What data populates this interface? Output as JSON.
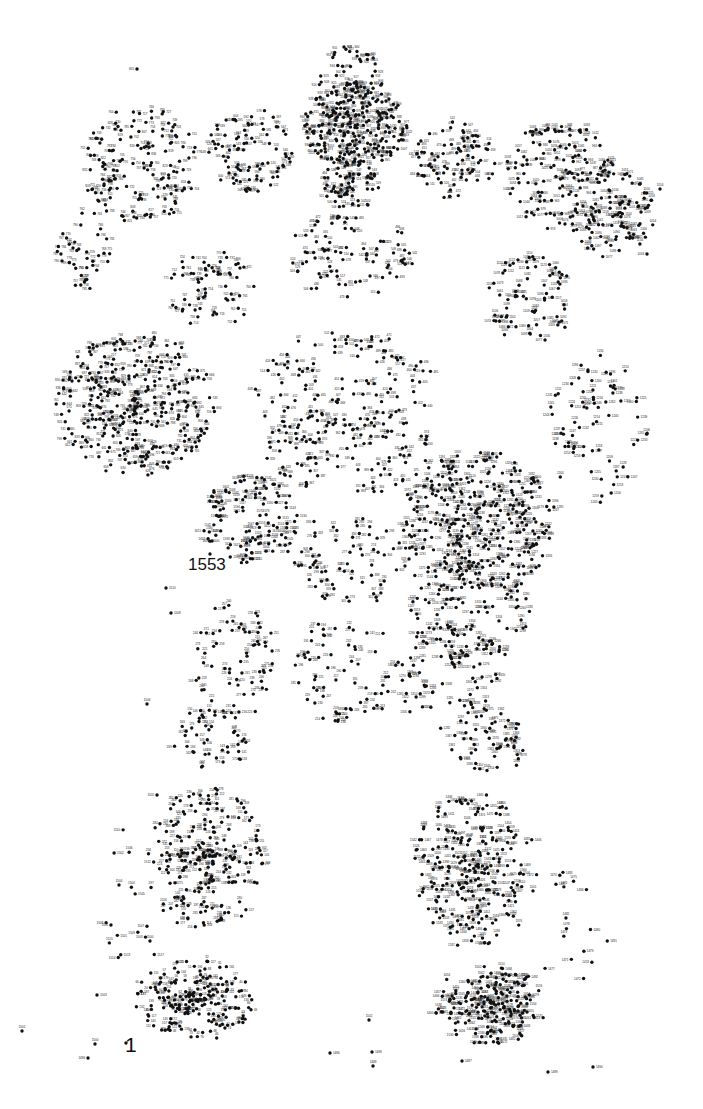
{
  "page": {
    "width": 703,
    "height": 1109,
    "background_color": "#ffffff",
    "dot_color": "#111111",
    "label_color": "#222222",
    "dot_radius": 1.7,
    "label_font_size": 3.0,
    "total_dots": 1553,
    "kind": "connect-the-dots puzzle"
  },
  "markers": {
    "start": {
      "number": "1",
      "x": 125,
      "y": 1034,
      "dot_x": 126,
      "dot_y": 1043
    },
    "end": {
      "number": "1553",
      "x": 188,
      "y": 556,
      "dot_x": 210,
      "dot_y": 554
    }
  },
  "regions": [
    {
      "name": "head-hair-crown",
      "cx": 350,
      "cy": 75,
      "rx": 34,
      "ry": 26,
      "count": 42,
      "num_start": 900,
      "density": "sparse"
    },
    {
      "name": "head-hair-mass",
      "cx": 355,
      "cy": 125,
      "rx": 52,
      "ry": 42,
      "count": 235,
      "num_start": 810,
      "density": "very-dense"
    },
    {
      "name": "face-neck",
      "cx": 352,
      "cy": 180,
      "rx": 30,
      "ry": 30,
      "count": 70,
      "num_start": 480,
      "density": "medium"
    },
    {
      "name": "left-shoulder-upper",
      "cx": 250,
      "cy": 150,
      "rx": 42,
      "ry": 42,
      "count": 85,
      "num_start": 520,
      "density": "sparse"
    },
    {
      "name": "right-shoulder-upper",
      "cx": 455,
      "cy": 160,
      "rx": 40,
      "ry": 40,
      "count": 80,
      "num_start": 440,
      "density": "sparse"
    },
    {
      "name": "left-arm-upper",
      "cx": 140,
      "cy": 165,
      "rx": 60,
      "ry": 58,
      "count": 140,
      "num_start": 700,
      "density": "medium"
    },
    {
      "name": "right-arm-upper",
      "cx": 560,
      "cy": 175,
      "rx": 55,
      "ry": 55,
      "count": 130,
      "num_start": 960,
      "density": "medium"
    },
    {
      "name": "right-hand-far",
      "cx": 612,
      "cy": 215,
      "rx": 42,
      "ry": 45,
      "count": 95,
      "num_start": 1040,
      "density": "medium"
    },
    {
      "name": "left-hand-far",
      "cx": 85,
      "cy": 250,
      "rx": 30,
      "ry": 40,
      "count": 38,
      "num_start": 755,
      "density": "sparse"
    },
    {
      "name": "torso-chest",
      "cx": 350,
      "cy": 255,
      "rx": 65,
      "ry": 42,
      "count": 80,
      "num_start": 470,
      "density": "sparse"
    },
    {
      "name": "left-forearm",
      "cx": 210,
      "cy": 290,
      "rx": 45,
      "ry": 40,
      "count": 60,
      "num_start": 712,
      "density": "sparse"
    },
    {
      "name": "right-forearm",
      "cx": 530,
      "cy": 300,
      "rx": 50,
      "ry": 45,
      "count": 70,
      "num_start": 1055,
      "density": "sparse"
    },
    {
      "name": "left-hand-cluster",
      "cx": 135,
      "cy": 405,
      "rx": 80,
      "ry": 72,
      "count": 330,
      "num_start": 555,
      "density": "very-dense"
    },
    {
      "name": "torso-mid",
      "cx": 345,
      "cy": 390,
      "rx": 90,
      "ry": 60,
      "count": 120,
      "num_start": 400,
      "density": "sparse"
    },
    {
      "name": "torso-lower",
      "cx": 350,
      "cy": 450,
      "rx": 85,
      "ry": 45,
      "count": 95,
      "num_start": 340,
      "density": "sparse"
    },
    {
      "name": "right-hand-cluster",
      "cx": 480,
      "cy": 520,
      "rx": 78,
      "ry": 70,
      "count": 300,
      "num_start": 1100,
      "density": "very-dense"
    },
    {
      "name": "right-arm-lower-far",
      "cx": 600,
      "cy": 430,
      "rx": 52,
      "ry": 75,
      "count": 70,
      "num_start": 1195,
      "density": "sparse"
    },
    {
      "name": "pocket-left",
      "cx": 250,
      "cy": 520,
      "rx": 48,
      "ry": 45,
      "count": 110,
      "num_start": 1515,
      "density": "medium"
    },
    {
      "name": "hips-center",
      "cx": 350,
      "cy": 560,
      "rx": 70,
      "ry": 45,
      "count": 70,
      "num_start": 270,
      "density": "sparse"
    },
    {
      "name": "right-hip-cluster",
      "cx": 470,
      "cy": 610,
      "rx": 60,
      "ry": 60,
      "count": 125,
      "num_start": 1230,
      "density": "medium"
    },
    {
      "name": "left-thigh",
      "cx": 235,
      "cy": 660,
      "rx": 42,
      "ry": 60,
      "count": 65,
      "num_start": 215,
      "density": "sparse"
    },
    {
      "name": "center-legs-upper",
      "cx": 345,
      "cy": 670,
      "rx": 55,
      "ry": 55,
      "count": 65,
      "num_start": 185,
      "density": "sparse"
    },
    {
      "name": "right-thigh",
      "cx": 450,
      "cy": 680,
      "rx": 50,
      "ry": 60,
      "count": 60,
      "num_start": 1265,
      "density": "sparse"
    },
    {
      "name": "left-knee",
      "cx": 210,
      "cy": 740,
      "rx": 38,
      "ry": 32,
      "count": 45,
      "num_start": 140,
      "density": "sparse"
    },
    {
      "name": "right-knee",
      "cx": 490,
      "cy": 740,
      "rx": 40,
      "ry": 35,
      "count": 50,
      "num_start": 1340,
      "density": "sparse"
    },
    {
      "name": "left-shin-cluster",
      "cx": 205,
      "cy": 860,
      "rx": 58,
      "ry": 75,
      "count": 215,
      "num_start": 100,
      "density": "dense"
    },
    {
      "name": "right-shin-cluster",
      "cx": 475,
      "cy": 870,
      "rx": 62,
      "ry": 80,
      "count": 230,
      "num_start": 1355,
      "density": "dense"
    },
    {
      "name": "left-foot-cluster",
      "cx": 195,
      "cy": 1000,
      "rx": 60,
      "ry": 42,
      "count": 185,
      "num_start": 10,
      "density": "dense"
    },
    {
      "name": "right-foot-cluster",
      "cx": 490,
      "cy": 1005,
      "rx": 58,
      "ry": 40,
      "count": 190,
      "num_start": 1400,
      "density": "dense"
    },
    {
      "name": "stray-left-low",
      "cx": 130,
      "cy": 900,
      "rx": 35,
      "ry": 80,
      "count": 18,
      "num_start": 1500,
      "density": "very-sparse"
    },
    {
      "name": "stray-right-low",
      "cx": 575,
      "cy": 930,
      "rx": 40,
      "ry": 70,
      "count": 16,
      "num_start": 1470,
      "density": "very-sparse"
    }
  ],
  "outliers": [
    {
      "number": "1501",
      "x": 22,
      "y": 1031
    },
    {
      "number": "1500",
      "x": 95,
      "y": 1044
    },
    {
      "number": "1496",
      "x": 88,
      "y": 1058
    },
    {
      "number": "1502",
      "x": 369,
      "y": 1020
    },
    {
      "number": "1498",
      "x": 372,
      "y": 1052
    },
    {
      "number": "1486",
      "x": 330,
      "y": 1053
    },
    {
      "number": "1488",
      "x": 373,
      "y": 1066
    },
    {
      "number": "1489",
      "x": 548,
      "y": 1072
    },
    {
      "number": "1490",
      "x": 593,
      "y": 1067
    },
    {
      "number": "1487",
      "x": 462,
      "y": 1061
    },
    {
      "number": "1503",
      "x": 97,
      "y": 995
    },
    {
      "number": "1504",
      "x": 119,
      "y": 885
    },
    {
      "number": "1505",
      "x": 157,
      "y": 795
    },
    {
      "number": "1506",
      "x": 147,
      "y": 704
    },
    {
      "number": "1508",
      "x": 171,
      "y": 613
    },
    {
      "number": "1510",
      "x": 166,
      "y": 588
    },
    {
      "number": "1554",
      "x": 660,
      "y": 189
    },
    {
      "number": "1034",
      "x": 647,
      "y": 254
    },
    {
      "number": "805",
      "x": 137,
      "y": 69
    },
    {
      "number": "908",
      "x": 344,
      "y": 47
    }
  ],
  "seed": 20240117
}
